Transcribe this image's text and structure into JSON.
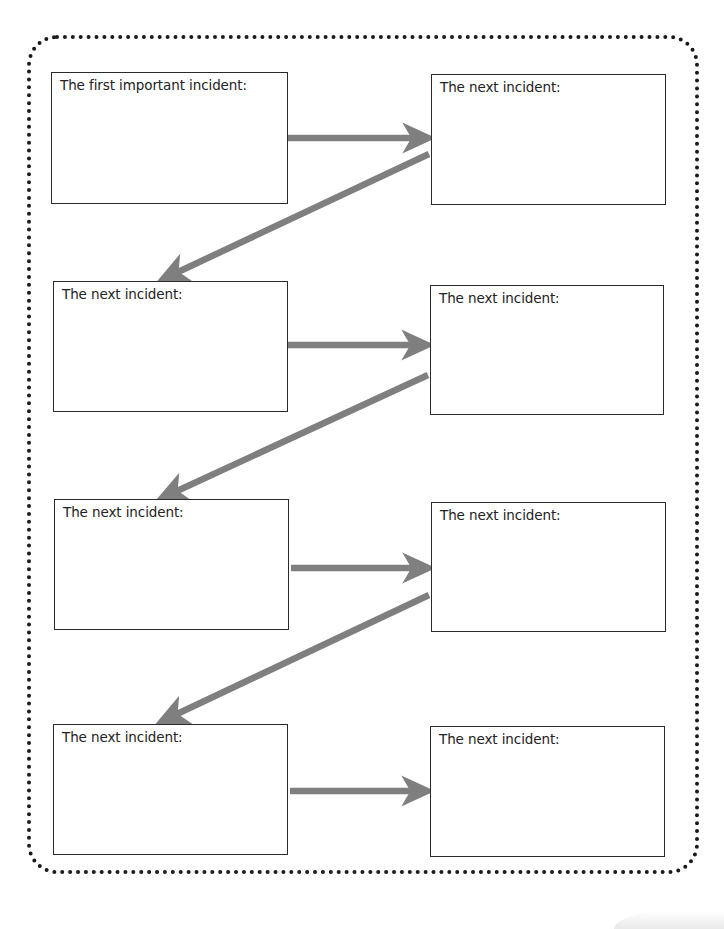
{
  "diagram": {
    "type": "sequence-of-events-organizer",
    "colors": {
      "border_dots": "#1a1a1a",
      "box_border": "#2b2b2b",
      "arrow": "#7f7f7f",
      "text": "#222222",
      "background": "#ffffff"
    },
    "boxes": [
      {
        "id": 1,
        "label": "The first important incident:",
        "x": 51,
        "y": 72,
        "w": 237,
        "h": 132
      },
      {
        "id": 2,
        "label": "The next incident:",
        "x": 431,
        "y": 74,
        "w": 235,
        "h": 131
      },
      {
        "id": 3,
        "label": "The next incident:",
        "x": 53,
        "y": 281,
        "w": 235,
        "h": 131
      },
      {
        "id": 4,
        "label": "The next incident:",
        "x": 430,
        "y": 285,
        "w": 234,
        "h": 130
      },
      {
        "id": 5,
        "label": "The next incident:",
        "x": 54,
        "y": 499,
        "w": 235,
        "h": 131
      },
      {
        "id": 6,
        "label": "The next incident:",
        "x": 431,
        "y": 502,
        "w": 235,
        "h": 130
      },
      {
        "id": 7,
        "label": "The next incident:",
        "x": 53,
        "y": 724,
        "w": 235,
        "h": 131
      },
      {
        "id": 8,
        "label": "The next incident:",
        "x": 430,
        "y": 726,
        "w": 235,
        "h": 131
      }
    ],
    "arrows": [
      {
        "from": 1,
        "to": 2,
        "direction": "right"
      },
      {
        "from": 2,
        "to": 3,
        "direction": "down-left"
      },
      {
        "from": 3,
        "to": 4,
        "direction": "right"
      },
      {
        "from": 4,
        "to": 5,
        "direction": "down-left"
      },
      {
        "from": 5,
        "to": 6,
        "direction": "right"
      },
      {
        "from": 6,
        "to": 7,
        "direction": "down-left"
      },
      {
        "from": 7,
        "to": 8,
        "direction": "right"
      }
    ]
  }
}
